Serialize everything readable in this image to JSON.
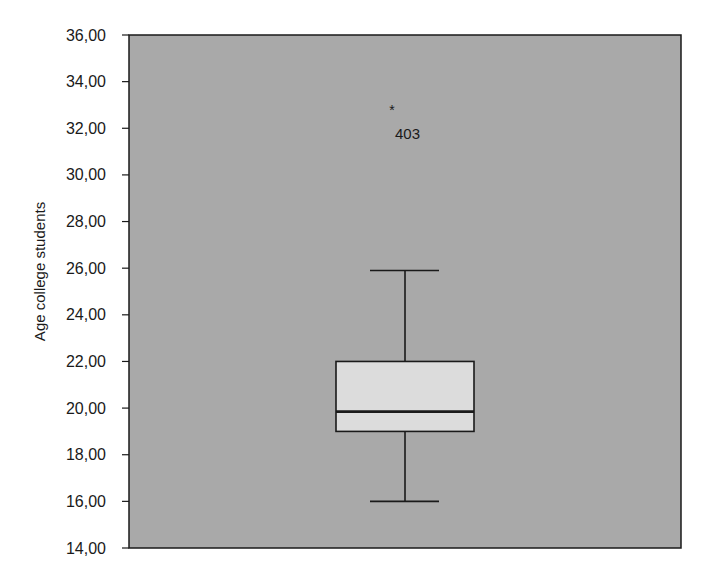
{
  "chart_data": {
    "type": "box",
    "title": "",
    "xlabel": "",
    "ylabel": "Age college students",
    "ylim": [
      14,
      36
    ],
    "yticks": [
      14,
      16,
      18,
      20,
      22,
      24,
      26,
      28,
      30,
      32,
      34,
      36
    ],
    "ytick_labels": [
      "14,00",
      "16,00",
      "18,00",
      "20,00",
      "22,00",
      "24,00",
      "26,00",
      "28,00",
      "30,00",
      "32,00",
      "34,00",
      "36,00"
    ],
    "grid": false,
    "legend": null,
    "series": [
      {
        "name": "Age college students",
        "whisker_low": 16.0,
        "q1": 19.0,
        "median": 19.85,
        "q3": 22.0,
        "whisker_high": 25.9,
        "outliers": [
          {
            "value": 32.5,
            "label": "403",
            "marker": "*"
          }
        ]
      }
    ],
    "colors": {
      "plot_background": "#a9a9a9",
      "box_fill": "#dcdcdc",
      "line": "#1a1a1a"
    }
  }
}
